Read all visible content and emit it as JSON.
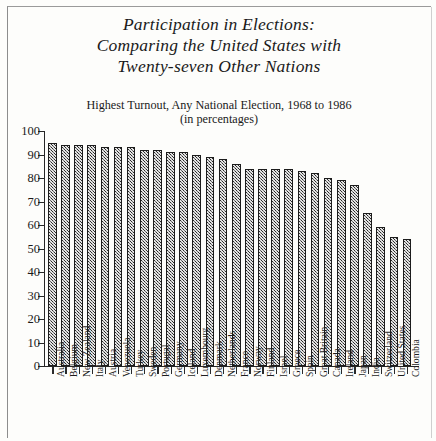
{
  "figure": {
    "title_lines": [
      "Participation in Elections:",
      "Comparing the United States with",
      "Twenty-seven Other Nations"
    ],
    "subtitle_lines": [
      "Highest Turnout, Any National Election, 1968 to 1986",
      "(in percentages)"
    ]
  },
  "chart_data": {
    "type": "bar",
    "title": "Participation in Elections: Comparing the United States with Twenty-seven Other Nations",
    "subtitle": "Highest Turnout, Any National Election, 1968 to 1986 (in percentages)",
    "xlabel": "",
    "ylabel": "",
    "ylim": [
      0,
      100
    ],
    "yticks": [
      0,
      10,
      20,
      30,
      40,
      50,
      60,
      70,
      80,
      90,
      100
    ],
    "ytick_labels": [
      "0",
      "10",
      "20",
      "30",
      "40",
      "50",
      "60",
      "70",
      "80",
      "90",
      "100"
    ],
    "grid": false,
    "legend": false,
    "categories": [
      "Australia",
      "Belgium",
      "New Zealand",
      "Italy",
      "Austria",
      "Venezuela",
      "Turkey",
      "Sweden",
      "Portugal",
      "Germany",
      "Iceland",
      "Luxembourg",
      "Denmark",
      "Netherlands",
      "France",
      "Norway",
      "Finland",
      "Israel",
      "Greece",
      "Spain",
      "Great Britain",
      "Canada",
      "Ireland",
      "Japan",
      "India",
      "Switzerland",
      "United States",
      "Colombia"
    ],
    "values": [
      95,
      94,
      94,
      94,
      93,
      93,
      93,
      92,
      92,
      91,
      91,
      90,
      89,
      88,
      86,
      84,
      84,
      84,
      84,
      83,
      82,
      80,
      79,
      77,
      65,
      59,
      55,
      54
    ]
  },
  "colors": {
    "bar_fill": "#6d6d6d",
    "bar_edge": "#1c1c1c",
    "axis": "#262626",
    "text": "#1a1a1a",
    "page_background": "#fdfdfb"
  }
}
